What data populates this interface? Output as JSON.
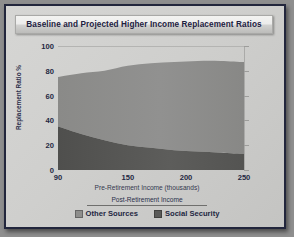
{
  "card": {
    "title": "Baseline and Projected Higher Income Replacement Ratios",
    "border_color": "#22263c",
    "background_color": "#cfcfcd"
  },
  "legend": {
    "header": "Post-Retirement Income",
    "items": [
      {
        "label": "Other Sources",
        "color": "#8e8e8c"
      },
      {
        "label": "Social Security",
        "color": "#5a5a58"
      }
    ]
  },
  "chart_data": {
    "type": "area",
    "title": "Baseline and Projected Higher Income Replacement Ratios",
    "xlabel": "Pre-Retirement Income (thousands)",
    "ylabel": "Replacement Ratio %",
    "xlim": [
      90,
      250
    ],
    "ylim": [
      0,
      100
    ],
    "grid": true,
    "stacked": true,
    "legend_position": "bottom",
    "xticks": [
      90,
      150,
      200,
      250
    ],
    "xtick_labels": [
      "90",
      "150",
      "200",
      "250"
    ],
    "yticks": [
      0,
      20,
      40,
      60,
      80,
      100
    ],
    "ytick_labels": [
      "0",
      "20",
      "40",
      "60",
      "80",
      "100"
    ],
    "x": [
      90,
      110,
      130,
      150,
      170,
      190,
      210,
      230,
      250
    ],
    "series": [
      {
        "name": "Social Security",
        "color": "#5a5a58",
        "values": [
          35,
          29,
          24,
          20,
          18,
          16,
          15,
          14,
          13
        ]
      },
      {
        "name": "Other Sources",
        "color": "#8e8e8c",
        "values": [
          40,
          49,
          56,
          64,
          68,
          71,
          73,
          74,
          74
        ]
      }
    ],
    "totals": [
      75,
      78,
      80,
      84,
      86,
      87,
      88,
      88,
      87
    ]
  }
}
